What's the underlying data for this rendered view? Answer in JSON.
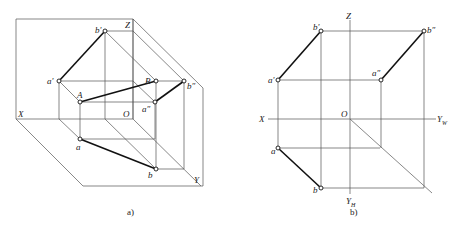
{
  "figure_a": {
    "caption": "a)",
    "labels": {
      "Z": "Z",
      "X": "X",
      "O": "O",
      "Y": "Y",
      "a_prime": "a'",
      "b_prime": "b'",
      "A": "A",
      "B": "B",
      "a": "a",
      "b": "b",
      "a_dprime": "a″",
      "b_dprime": "b″"
    }
  },
  "figure_b": {
    "caption": "b)",
    "labels": {
      "Z": "Z",
      "X": "X",
      "O": "O",
      "YW": "Y",
      "YW_sub": "W",
      "YH": "Y",
      "YH_sub": "H",
      "a_prime": "a'",
      "b_prime": "b'",
      "a": "a",
      "b": "b",
      "a_dprime": "a″",
      "b_dprime": "b″"
    }
  }
}
